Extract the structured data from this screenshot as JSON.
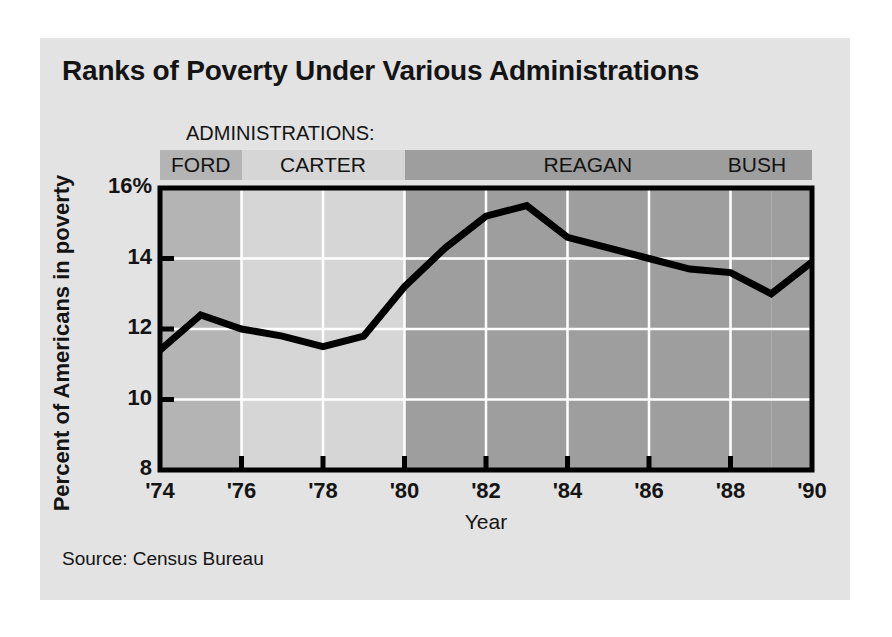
{
  "figure": {
    "title": "Ranks of Poverty Under Various Administrations",
    "source": "Source: Census Bureau",
    "admin_heading": "ADMINISTRATIONS:",
    "panel_color": "#e3e3e3",
    "line_color": "#000000",
    "axis_color": "#000000",
    "grid_color": "#ffffff"
  },
  "chart_data": {
    "type": "line",
    "title": "Ranks of Poverty Under Various Administrations",
    "subtitle": "",
    "xlabel": "Year",
    "ylabel": "Percent of Americans in poverty",
    "xlim": [
      1974,
      1990
    ],
    "ylim": [
      8,
      16
    ],
    "grid": true,
    "legend_position": "none",
    "ytick_labels": [
      "16%",
      "14",
      "12",
      "10",
      "8"
    ],
    "ytick_values": [
      16,
      14,
      12,
      10,
      8
    ],
    "xtick_labels": [
      "'74",
      "'76",
      "'78",
      "'80",
      "'82",
      "'84",
      "'86",
      "'88",
      "'90"
    ],
    "xtick_values": [
      1974,
      1976,
      1978,
      1980,
      1982,
      1984,
      1986,
      1988,
      1990
    ],
    "x": [
      1974,
      1975,
      1976,
      1977,
      1978,
      1979,
      1980,
      1981,
      1982,
      1983,
      1984,
      1985,
      1986,
      1987,
      1988,
      1989,
      1990
    ],
    "values": [
      11.4,
      12.4,
      12.0,
      11.8,
      11.5,
      11.8,
      13.2,
      14.3,
      15.2,
      15.5,
      14.6,
      14.3,
      14.0,
      13.7,
      13.6,
      13.0,
      13.9
    ],
    "series": [
      {
        "name": "Percent of Americans in poverty",
        "values": [
          11.4,
          12.4,
          12.0,
          11.8,
          11.5,
          11.8,
          13.2,
          14.3,
          15.2,
          15.5,
          14.6,
          14.3,
          14.0,
          13.7,
          13.6,
          13.0,
          13.9
        ]
      }
    ],
    "bands": [
      {
        "label": "FORD",
        "start": 1974,
        "end": 1976,
        "color": "#b4b4b4"
      },
      {
        "label": "CARTER",
        "start": 1976,
        "end": 1980,
        "color": "#d6d6d6"
      },
      {
        "label": "REAGAN",
        "start": 1980,
        "end": 1989,
        "color": "#9e9e9e"
      },
      {
        "label": "BUSH",
        "start": 1989,
        "end": 1990,
        "color": "#9e9e9e"
      }
    ]
  }
}
